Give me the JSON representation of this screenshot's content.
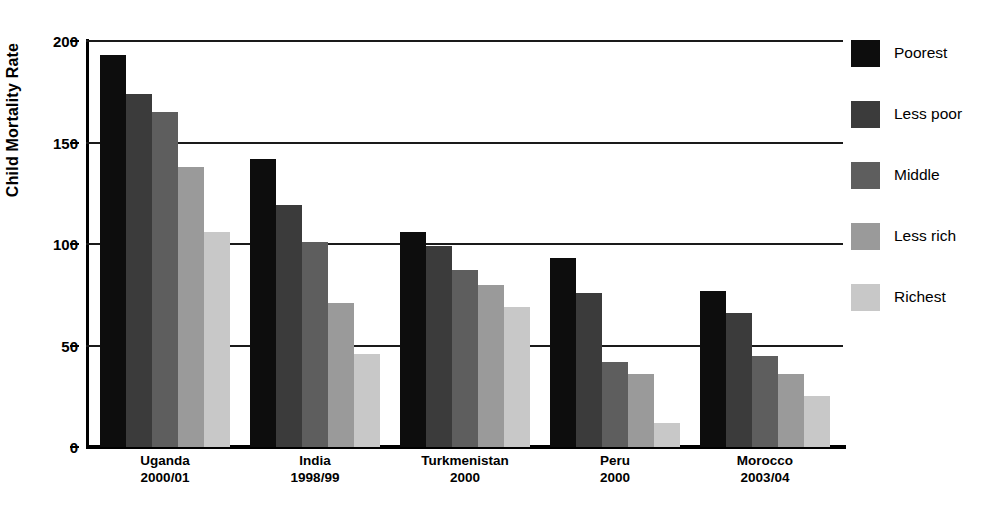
{
  "chart_data": {
    "type": "bar",
    "title": "",
    "xlabel": "",
    "ylabel": "Child Mortality Rate",
    "ylim": [
      0,
      200
    ],
    "yticks": [
      0,
      50,
      100,
      150,
      200
    ],
    "ytick_labels": [
      "0",
      "50",
      "100",
      "150",
      "200"
    ],
    "grid": true,
    "legend_position": "right",
    "categories": [
      {
        "name": "Uganda",
        "year": "2000/01"
      },
      {
        "name": "India",
        "year": "1998/99"
      },
      {
        "name": "Turkmenistan",
        "year": "2000"
      },
      {
        "name": "Peru",
        "year": "2000"
      },
      {
        "name": "Morocco",
        "year": "2003/04"
      }
    ],
    "category_labels": [
      "Uganda 2000/01",
      "India 1998/99",
      "Turkmenistan 2000",
      "Peru 2000",
      "Morocco 2003/04"
    ],
    "series": [
      {
        "name": "Poorest",
        "color": "#0d0d0d",
        "values": [
          193,
          142,
          106,
          93,
          77
        ]
      },
      {
        "name": "Less poor",
        "color": "#3b3b3b",
        "values": [
          174,
          119,
          99,
          76,
          66
        ]
      },
      {
        "name": "Middle",
        "color": "#5e5e5e",
        "values": [
          165,
          101,
          87,
          42,
          45
        ]
      },
      {
        "name": "Less rich",
        "color": "#9a9a9a",
        "values": [
          138,
          71,
          80,
          36,
          36
        ]
      },
      {
        "name": "Richest",
        "color": "#c8c8c8",
        "values": [
          106,
          46,
          69,
          12,
          25
        ]
      }
    ]
  },
  "legend": {
    "items": [
      {
        "label": "Poorest",
        "color": "#0d0d0d"
      },
      {
        "label": "Less poor",
        "color": "#3b3b3b"
      },
      {
        "label": "Middle",
        "color": "#5e5e5e"
      },
      {
        "label": "Less rich",
        "color": "#9a9a9a"
      },
      {
        "label": "Richest",
        "color": "#c8c8c8"
      }
    ]
  },
  "axis": {
    "y_title": "Child Mortality Rate"
  }
}
